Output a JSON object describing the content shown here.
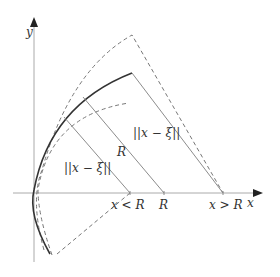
{
  "diagram": {
    "type": "geometric construction",
    "axes": {
      "x_label": "x",
      "y_label": "y"
    },
    "labels": {
      "distance_inner": "||x − ξ||",
      "radius": "R",
      "distance_outer": "||x − ξ||",
      "point_less": "x < R",
      "point_equal": "R",
      "point_greater": "x > R"
    },
    "curves": [
      {
        "name": "circle-radius-R",
        "style": "solid"
      },
      {
        "name": "outer-dashed-arc",
        "style": "dashed"
      },
      {
        "name": "inner-dashed-arc",
        "style": "dashed"
      }
    ],
    "colors": {
      "axis": "#999999",
      "solid_curve": "#333333",
      "dashed": "#777777",
      "ray": "#8c8c8c",
      "text": "#333333"
    }
  }
}
